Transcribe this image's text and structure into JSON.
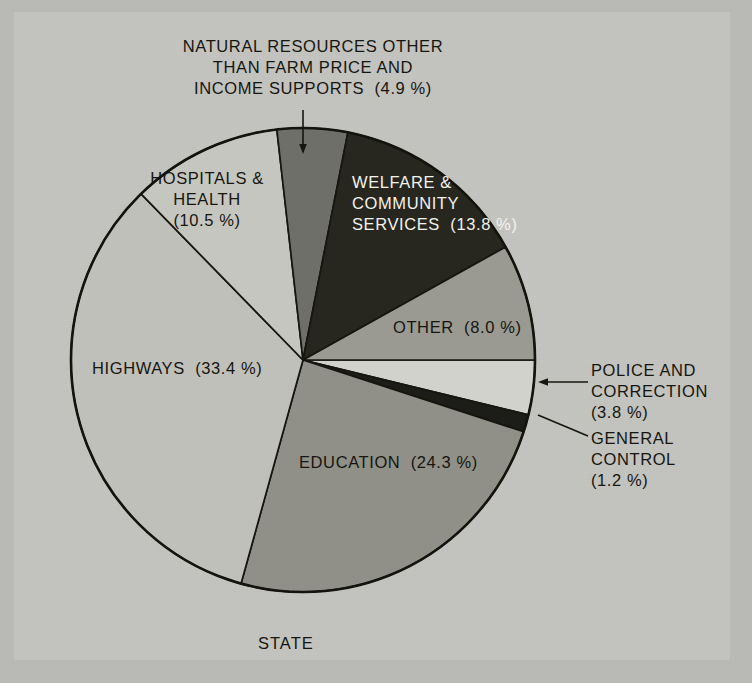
{
  "figure": {
    "caption": "STATE",
    "background_color": "#c3c3bf",
    "border_color": "#b9b9b5"
  },
  "chart_data": {
    "type": "pie",
    "title": "",
    "subtitle": "",
    "caption": "STATE",
    "units": "percent of total expenditure",
    "legend_position": "inline-labels",
    "categories": [
      "POLICE AND CORRECTION",
      "GENERAL CONTROL",
      "EDUCATION",
      "HIGHWAYS",
      "HOSPITALS & HEALTH",
      "NATURAL RESOURCES OTHER THAN FARM PRICE AND INCOME SUPPORTS",
      "WELFARE & COMMUNITY SERVICES",
      "OTHER"
    ],
    "values": [
      3.8,
      1.2,
      24.3,
      33.4,
      10.5,
      4.9,
      13.8,
      8.0
    ],
    "slices": [
      {
        "name": "POLICE AND CORRECTION",
        "value": 3.8,
        "value_text": "(3.8 %)",
        "color": "#d2d2cd",
        "label_lines": [
          "POLICE AND",
          "CORRECTION",
          "(3.8 %)"
        ],
        "label_placement": "callout-right",
        "start_angle_deg": 0.0,
        "end_angle_deg": 13.68
      },
      {
        "name": "GENERAL CONTROL",
        "value": 1.2,
        "value_text": "(1.2 %)",
        "color": "#1c1c19",
        "label_lines": [
          "GENERAL",
          "CONTROL",
          "(1.2 %)"
        ],
        "label_placement": "callout-right",
        "start_angle_deg": 13.68,
        "end_angle_deg": 18.0
      },
      {
        "name": "EDUCATION",
        "value": 24.3,
        "value_text": "(24.3 %)",
        "color": "#909089",
        "label_lines": [
          "EDUCATION  (24.3 %)"
        ],
        "label_placement": "inside",
        "start_angle_deg": 18.0,
        "end_angle_deg": 105.48
      },
      {
        "name": "HIGHWAYS",
        "value": 33.4,
        "value_text": "(33.4 %)",
        "color": "#c0c0ba",
        "label_lines": [
          "HIGHWAYS  (33.4 %)"
        ],
        "label_placement": "inside",
        "start_angle_deg": 105.48,
        "end_angle_deg": 225.72
      },
      {
        "name": "HOSPITALS & HEALTH",
        "value": 10.5,
        "value_text": "(10.5 %)",
        "color": "#c6c6c0",
        "label_lines": [
          "HOSPITALS &",
          "HEALTH",
          "(10.5 %)"
        ],
        "label_placement": "inside",
        "start_angle_deg": 225.72,
        "end_angle_deg": 263.52
      },
      {
        "name": "NATURAL RESOURCES OTHER THAN FARM PRICE AND INCOME SUPPORTS",
        "value": 4.9,
        "value_text": "(4.9 %)",
        "color": "#6f6f69",
        "label_lines": [
          "NATURAL RESOURCES OTHER",
          "THAN FARM PRICE AND",
          "INCOME SUPPORTS  (4.9 %)"
        ],
        "label_placement": "callout-top",
        "start_angle_deg": 263.52,
        "end_angle_deg": 281.16
      },
      {
        "name": "WELFARE & COMMUNITY SERVICES",
        "value": 13.8,
        "value_text": "(13.8 %)",
        "color": "#27271f",
        "label_lines": [
          "WELFARE &",
          "COMMUNITY",
          "SERVICES  (13.8 %)"
        ],
        "label_placement": "inside",
        "label_color": "#f2f2ee",
        "start_angle_deg": 281.16,
        "end_angle_deg": 330.84
      },
      {
        "name": "OTHER",
        "value": 8.0,
        "value_text": "(8.0 %)",
        "color": "#9a9a93",
        "label_lines": [
          "OTHER  (8.0 %)"
        ],
        "label_placement": "inside",
        "start_angle_deg": 330.84,
        "end_angle_deg": 360.0
      }
    ]
  },
  "labels": {
    "natural_resources": "NATURAL RESOURCES OTHER\nTHAN FARM PRICE AND\nINCOME SUPPORTS  (4.9 %)",
    "hospitals_health": "HOSPITALS &\nHEALTH\n(10.5 %)",
    "welfare_community": "WELFARE &\nCOMMUNITY\nSERVICES  (13.8 %)",
    "other": "OTHER  (8.0 %)",
    "highways": "HIGHWAYS  (33.4 %)",
    "education": "EDUCATION  (24.3 %)",
    "police_correction": "POLICE AND\nCORRECTION\n(3.8 %)",
    "general_control": "GENERAL\nCONTROL\n(1.2 %)",
    "state": "STATE"
  }
}
